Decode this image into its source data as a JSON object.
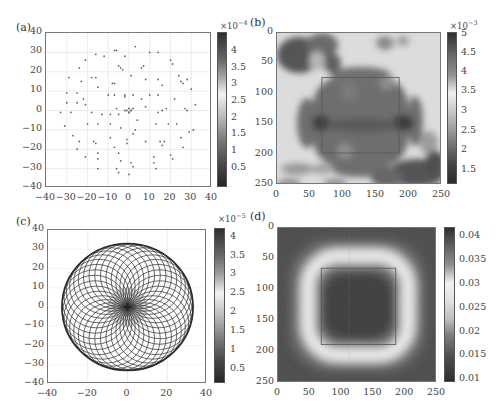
{
  "panels": {
    "a": {
      "label": "(a)",
      "cb_exponent_base": "×10",
      "cb_exponent_power": "−4",
      "cb_ticks": [
        "4",
        "3.5",
        "3",
        "2.5",
        "2",
        "1.5",
        "1",
        "0.5"
      ],
      "x_ticks": [
        "−40",
        "−30",
        "−20",
        "−10",
        "0",
        "10",
        "20",
        "30",
        "40"
      ],
      "y_ticks": [
        "40",
        "30",
        "20",
        "10",
        "0",
        "−10",
        "−20",
        "−30",
        "−40"
      ]
    },
    "b": {
      "label": "(b)",
      "cb_exponent_base": "×10",
      "cb_exponent_power": "−3",
      "cb_ticks": [
        "5",
        "4.5",
        "4",
        "3.5",
        "3",
        "2.5",
        "2",
        "1.5"
      ],
      "x_ticks": [
        "0",
        "50",
        "100",
        "150",
        "200",
        "250"
      ],
      "y_ticks": [
        "0",
        "50",
        "100",
        "150",
        "200",
        "250"
      ]
    },
    "c": {
      "label": "(c)",
      "cb_exponent_base": "×10",
      "cb_exponent_power": "−5",
      "cb_ticks": [
        "4",
        "3.5",
        "3",
        "2.5",
        "2",
        "1.5",
        "1",
        "0.5"
      ],
      "x_ticks": [
        "−40",
        "−20",
        "0",
        "20",
        "40"
      ],
      "y_ticks": [
        "40",
        "30",
        "20",
        "10",
        "0",
        "−10",
        "−20",
        "−30",
        "−40"
      ]
    },
    "d": {
      "label": "(d)",
      "cb_ticks": [
        "0.04",
        "0.035",
        "0.03",
        "0.025",
        "0.02",
        "0.015",
        "0.01"
      ],
      "x_ticks": [
        "0",
        "50",
        "100",
        "150",
        "200",
        "250"
      ],
      "y_ticks": [
        "0",
        "50",
        "100",
        "150",
        "200",
        "250"
      ]
    }
  },
  "chart_data": [
    {
      "type": "scatter",
      "title": "(a)",
      "xlabel": "",
      "ylabel": "",
      "xlim": [
        -40,
        40
      ],
      "ylim": [
        -40,
        40
      ],
      "grid": true,
      "colorbar": {
        "range": [
          0,
          0.00045
        ],
        "ticks": [
          0.5,
          1,
          1.5,
          2,
          2.5,
          3,
          3.5,
          4
        ],
        "scale": "×10^-4"
      },
      "points": [
        [
          3,
          33
        ],
        [
          -6,
          31
        ],
        [
          -7,
          31
        ],
        [
          10,
          30
        ],
        [
          14,
          30
        ],
        [
          -16,
          29
        ],
        [
          -12,
          28
        ],
        [
          -2,
          28
        ],
        [
          20,
          26
        ],
        [
          -21,
          26
        ],
        [
          21,
          24
        ],
        [
          -5,
          23
        ],
        [
          7,
          23
        ],
        [
          6,
          22
        ],
        [
          -4,
          22
        ],
        [
          -3,
          21
        ],
        [
          -24,
          22
        ],
        [
          -18,
          17
        ],
        [
          -29,
          17
        ],
        [
          -23,
          15
        ],
        [
          -16,
          17
        ],
        [
          1,
          18
        ],
        [
          8,
          16
        ],
        [
          14,
          16
        ],
        [
          26,
          14
        ],
        [
          25,
          15
        ],
        [
          24,
          18
        ],
        [
          28,
          16
        ],
        [
          30,
          11
        ],
        [
          16,
          13
        ],
        [
          -8,
          14
        ],
        [
          -7,
          14
        ],
        [
          -15,
          12
        ],
        [
          -30,
          9
        ],
        [
          -25,
          9
        ],
        [
          -10,
          8
        ],
        [
          -7,
          8
        ],
        [
          -2,
          8
        ],
        [
          -2,
          7
        ],
        [
          2,
          8
        ],
        [
          10,
          8
        ],
        [
          14,
          8
        ],
        [
          -22,
          6
        ],
        [
          6,
          6
        ],
        [
          22,
          6
        ],
        [
          -30,
          4
        ],
        [
          -25,
          4
        ],
        [
          -21,
          3
        ],
        [
          32,
          3
        ],
        [
          -6,
          1
        ],
        [
          -18,
          -1
        ],
        [
          -28,
          -1
        ],
        [
          -33,
          -1
        ],
        [
          -13,
          -2
        ],
        [
          -9,
          -2
        ],
        [
          -5,
          -2
        ],
        [
          0,
          -1
        ],
        [
          1,
          0
        ],
        [
          8,
          2
        ],
        [
          14,
          -1
        ],
        [
          16,
          0
        ],
        [
          18,
          1
        ],
        [
          27,
          1
        ],
        [
          28,
          0
        ],
        [
          4,
          -5
        ],
        [
          -9,
          -7
        ],
        [
          -15,
          -7
        ],
        [
          -31,
          -8
        ],
        [
          -20,
          -7
        ],
        [
          -4,
          -9
        ],
        [
          3,
          -10
        ],
        [
          13,
          -7
        ],
        [
          19,
          -7
        ],
        [
          23,
          -7
        ],
        [
          -27,
          -13
        ],
        [
          -9,
          -14
        ],
        [
          -1,
          -15
        ],
        [
          -24,
          -16
        ],
        [
          -17,
          -16
        ],
        [
          -16,
          -17
        ],
        [
          -25,
          -20
        ],
        [
          -1,
          -17
        ],
        [
          2,
          -12
        ],
        [
          8,
          -16
        ],
        [
          15,
          -16
        ],
        [
          17,
          -16
        ],
        [
          29,
          -11
        ],
        [
          31,
          -10
        ],
        [
          25,
          -14
        ],
        [
          -7,
          -19
        ],
        [
          16,
          -18
        ],
        [
          26,
          -19
        ],
        [
          -15,
          -22
        ],
        [
          -5,
          -22
        ],
        [
          -21,
          -24
        ],
        [
          -15,
          -25
        ],
        [
          -4,
          -26
        ],
        [
          12,
          -24
        ],
        [
          20,
          -23
        ],
        [
          21,
          -25
        ],
        [
          1,
          -27
        ],
        [
          2,
          -29
        ],
        [
          12,
          -27
        ],
        [
          13,
          -30
        ],
        [
          -15,
          -30
        ],
        [
          -6,
          -30
        ],
        [
          -5,
          -32
        ],
        [
          0,
          -33
        ]
      ]
    },
    {
      "type": "heatmap",
      "title": "(b)",
      "xlim": [
        0,
        250
      ],
      "ylim": [
        250,
        0
      ],
      "colorbar": {
        "range": [
          0.0012,
          0.005
        ],
        "ticks": [
          1.5,
          2,
          2.5,
          3,
          3.5,
          4,
          4.5,
          5
        ],
        "scale": "×10^-3"
      },
      "overlay_rectangle": {
        "x": [
          68,
          185
        ],
        "y": [
          68,
          185
        ]
      },
      "description": "Darker (≈4.5e-3) lobed blob inside the central square, bright (≈3.5e-3) surrounding ring, dark patches at top-left, lower-right corner"
    },
    {
      "type": "line",
      "title": "(c)",
      "xlim": [
        -40,
        40
      ],
      "ylim": [
        -40,
        40
      ],
      "grid": true,
      "colorbar": {
        "range": [
          0,
          4.3e-05
        ],
        "ticks": [
          0.5,
          1,
          1.5,
          2,
          2.5,
          3,
          3.5,
          4
        ],
        "scale": "×10^-5"
      },
      "description": "Rosette of overlapping circles of radius ≈16.5 whose centers lie on a circle of radius ≈16.5, forming an envelope of radius ≈33 centered at origin"
    },
    {
      "type": "heatmap",
      "title": "(d)",
      "xlim": [
        0,
        250
      ],
      "ylim": [
        250,
        0
      ],
      "colorbar": {
        "range": [
          0.01,
          0.042
        ],
        "ticks": [
          0.01,
          0.015,
          0.02,
          0.025,
          0.03,
          0.035,
          0.04
        ]
      },
      "overlay_rectangle": {
        "x": [
          68,
          185
        ],
        "y": [
          68,
          185
        ]
      },
      "description": "Dark center (≈0.04) inside the square, bright rounded-square ring (≈0.03) around radius ≈75, darker outer region"
    }
  ]
}
